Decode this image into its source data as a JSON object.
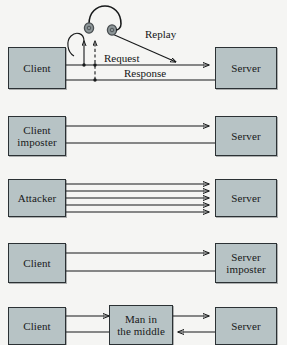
{
  "diagram": {
    "background_color": "#f5f5f3",
    "node_fill_color": "#b7c3c5",
    "node_border_color": "#2b3134",
    "arrow_color": "#17191a",
    "rows": [
      {
        "name": "replay-attack",
        "left_node": "Client",
        "right_node": "Server",
        "labels": [
          "Request",
          "Response",
          "Replay"
        ],
        "eavesdropper_icon": "headphones-icon"
      },
      {
        "name": "client-imposter-attack",
        "left_node_line1": "Client",
        "left_node_line2": "imposter",
        "right_node": "Server",
        "labels": []
      },
      {
        "name": "denial-of-service-attack",
        "left_node": "Attacker",
        "right_node": "Server",
        "arrow_count": 5,
        "labels": []
      },
      {
        "name": "server-imposter-attack",
        "left_node": "Client",
        "right_node_line1": "Server",
        "right_node_line2": "imposter",
        "labels": []
      },
      {
        "name": "man-in-the-middle-attack",
        "left_node": "Client",
        "middle_node_line1": "Man in",
        "middle_node_line2": "the middle",
        "right_node": "Server",
        "labels": []
      }
    ]
  }
}
